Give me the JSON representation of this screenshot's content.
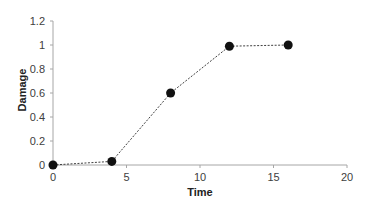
{
  "chart_data": {
    "type": "line",
    "title": "",
    "xlabel": "Time",
    "ylabel": "Damage",
    "xlim": [
      0,
      20
    ],
    "ylim": [
      0,
      1.2
    ],
    "xticks": [
      0,
      5,
      10,
      15,
      20
    ],
    "yticks": [
      0,
      0.2,
      0.4,
      0.6,
      0.8,
      1,
      1.2
    ],
    "xtick_labels": [
      "0",
      "5",
      "10",
      "15",
      "20"
    ],
    "ytick_labels": [
      "0",
      "0.2",
      "0.4",
      "0.6",
      "0.8",
      "1",
      "1.2"
    ],
    "grid": false,
    "legend": null,
    "series": [
      {
        "name": "Damage",
        "x": [
          0,
          4,
          8,
          12,
          16
        ],
        "values": [
          0,
          0.03,
          0.6,
          0.99,
          1.0
        ],
        "line_style": "dotted",
        "marker": "circle",
        "color": "#1a1a1a"
      }
    ]
  },
  "colors": {
    "axis": "#a6a6a6",
    "line": "#404040",
    "marker": "#111111",
    "text": "#404040"
  }
}
